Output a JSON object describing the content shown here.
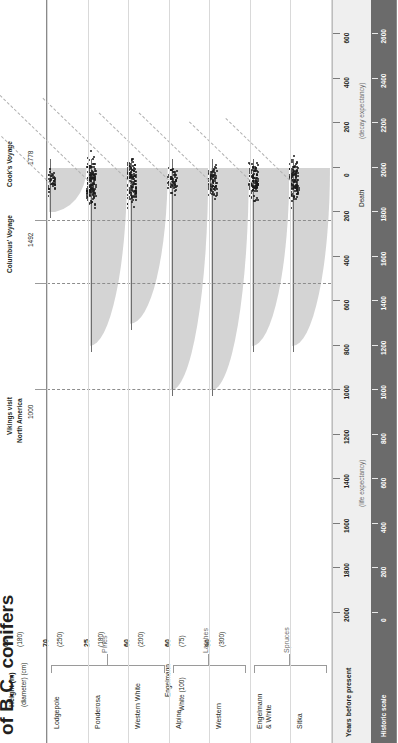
{
  "figure": {
    "title": "of B.C. conifers",
    "orientation": "rotated-90-ccw"
  },
  "header": {
    "height_label_line1": "Height (m)",
    "height_label_line2": "(diameter) (cm)"
  },
  "annotations": [
    {
      "name": "vikings",
      "line1": "Vikings visit",
      "line2": "North America",
      "year": "1000"
    },
    {
      "name": "columbus",
      "line1": "Columbus' Voyage",
      "line2": "",
      "year": "1492"
    },
    {
      "name": "cook",
      "line1": "Cook's Voyage",
      "line2": "",
      "year": "1778"
    }
  ],
  "groups": [
    {
      "label": "Pines",
      "members": [
        "Lodgepole",
        "Ponderosa",
        "Western White"
      ]
    },
    {
      "label": "Larches",
      "members": [
        "Alpine",
        "Western"
      ]
    },
    {
      "label": "Spruces",
      "members": [
        "Engelmann\n& White",
        "Sitka"
      ]
    }
  ],
  "axes": {
    "years_before_present_label": "Years before present",
    "historic_scale_label": "Historic scale",
    "life_expectancy_label": "(life expectancy)",
    "decay_expectancy_label": "(decay expectancy)",
    "death_label": "Death",
    "years_before_present_ticks": [
      2000,
      1800,
      1600,
      1400,
      1200,
      1000,
      800,
      600,
      400,
      200,
      0,
      200,
      400,
      600
    ],
    "historic_scale_ticks": [
      0,
      200,
      400,
      600,
      800,
      1000,
      1200,
      1400,
      1600,
      1800,
      2000,
      2200,
      2400,
      2600
    ]
  },
  "chart_data": {
    "type": "area",
    "title": "of B.C. conifers",
    "xlabel": "Years before present",
    "ylabel": "",
    "xlim": [
      2100,
      -700
    ],
    "grid": false,
    "legend": "none",
    "note": "Each species panel shows a grey lifespan/decay wedge, a swarm of black dots at the death point (age at death distribution), and a dashed trend line rising after death.",
    "series": [
      {
        "name": "Lodgepole",
        "group": "Pines",
        "height_m": 25,
        "diameter_cm": 30,
        "life_expectancy_years": 200,
        "decay_expectancy_years": 100,
        "wedge_start_years_bp": 200,
        "wedge_end_years_bp": 0,
        "dot_count": 40
      },
      {
        "name": "Ponderosa",
        "group": "Pines",
        "height_m": 60,
        "diameter_cm": 180,
        "life_expectancy_years": 800,
        "decay_expectancy_years": 250,
        "wedge_start_years_bp": 800,
        "wedge_end_years_bp": 0,
        "dot_count": 150
      },
      {
        "name": "Western White",
        "group": "Pines",
        "height_m": 70,
        "diameter_cm": 250,
        "life_expectancy_years": 700,
        "decay_expectancy_years": 230,
        "wedge_start_years_bp": 700,
        "wedge_end_years_bp": 0,
        "dot_count": 130
      },
      {
        "name": "Alpine",
        "group": "Larches",
        "height_m": 25,
        "diameter_cm": 180,
        "life_expectancy_years": 1000,
        "decay_expectancy_years": 180,
        "wedge_start_years_bp": 1000,
        "wedge_end_years_bp": 0,
        "dot_count": 60
      },
      {
        "name": "Western",
        "group": "Larches",
        "height_m": 60,
        "diameter_cm": 200,
        "life_expectancy_years": 1000,
        "decay_expectancy_years": 180,
        "wedge_start_years_bp": 1000,
        "wedge_end_years_bp": 0,
        "dot_count": 80
      },
      {
        "name": "Engelmann & White",
        "group": "Spruces",
        "height_m": 60,
        "diameter_cm_engelmann": 75,
        "diameter_cm_white": 100,
        "life_expectancy_years": 800,
        "decay_expectancy_years": 150,
        "wedge_start_years_bp": 800,
        "wedge_end_years_bp": 0,
        "dot_count": 110
      },
      {
        "name": "Sitka",
        "group": "Spruces",
        "height_m": 90,
        "diameter_cm": 300,
        "life_expectancy_years": 800,
        "decay_expectancy_years": 160,
        "wedge_start_years_bp": 800,
        "wedge_end_years_bp": 0,
        "dot_count": 120
      }
    ],
    "event_markers": [
      {
        "label": "Vikings visit North America",
        "years_before_present": 1000
      },
      {
        "label": "Columbus' Voyage",
        "years_before_present": 520
      },
      {
        "label": "Cook's Voyage",
        "years_before_present": 240
      }
    ]
  },
  "species_header": [
    {
      "height": "25",
      "diameter": "(30)",
      "extra1": "",
      "extra2": ""
    },
    {
      "height": "60",
      "diameter": "(180)",
      "extra1": "",
      "extra2": ""
    },
    {
      "height": "70",
      "diameter": "(250)",
      "extra1": "",
      "extra2": ""
    },
    {
      "height": "25",
      "diameter": "(180)",
      "extra1": "",
      "extra2": ""
    },
    {
      "height": "60",
      "diameter": "(200)",
      "extra1": "",
      "extra2": ""
    },
    {
      "height": "60",
      "diameter": "(75)",
      "extra1": "Engelmann",
      "extra2": "White (100)"
    },
    {
      "height": "90",
      "diameter": "(300)",
      "extra1": "",
      "extra2": ""
    }
  ],
  "species_names": [
    "Lodgepole",
    "Ponderosa",
    "Western White",
    "Alpine",
    "Western",
    "Engelmann",
    "& White",
    "Sitka"
  ],
  "colors": {
    "wedge": "#d4d4d4",
    "dot": "#1a1a1a",
    "scale_band": "#efefef",
    "historic_band": "#6b6b6b",
    "text": "#231f20",
    "rule": "#8a8a8a",
    "dash": "#8d8d8d"
  }
}
